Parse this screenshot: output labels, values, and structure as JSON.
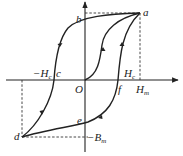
{
  "diagram": {
    "type": "hysteresis-loop",
    "points": {
      "a": "a",
      "b": "b",
      "c": "c",
      "d": "d",
      "e": "e",
      "f": "f",
      "O": "O"
    },
    "labels": {
      "neg_Hc_prefix": "−H",
      "neg_Hc_sub": "c",
      "Hc_main": "H",
      "Hc_sub": "c",
      "Hm_main": "H",
      "Hm_sub": "m",
      "neg_Bm_prefix": "−B",
      "neg_Bm_sub": "m"
    },
    "colors": {
      "stroke": "#222222",
      "background": "#ffffff"
    }
  }
}
